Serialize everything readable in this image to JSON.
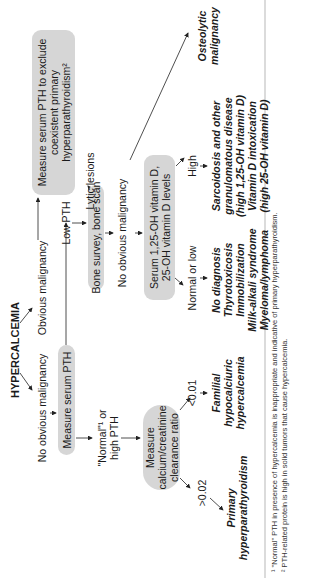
{
  "title": "HYPERCALCEMIA",
  "branches": {
    "no_malignancy": "No obvious malignancy",
    "obvious_malignancy": "Obvious malignancy",
    "normal_high_pth": [
      "\"Normal\"¹ or",
      "high PTH"
    ],
    "low_pth": "Low PTH",
    "no_obvious_malignancy_2": "No obvious malignancy",
    "lytic_lesions": "Lytic lesions",
    "normal_or_low": "Normal or low",
    "high": "High",
    "gt_002": ">0.02",
    "lt_001": "<0.01"
  },
  "boxes": {
    "measure_pth": "Measure serum PTH",
    "exclude_pth": [
      "Measure serum PTH to exclude",
      "coexistent primary",
      "hyperparathyroidism²"
    ],
    "bone_survey": "Bone survey, bone scan",
    "serum_vitd": [
      "Serum 1,25-OH vitamin D,",
      "25-OH vitamin D levels"
    ],
    "ca_cr": [
      "Measure",
      "calcium/creatinine",
      "clearance ratio"
    ]
  },
  "outcomes": {
    "primary_hpt": [
      "Primary",
      "hyperparathyroidism"
    ],
    "fhh": [
      "Familial",
      "hypocalciuric",
      "hypercalcemia"
    ],
    "normal_low_list": [
      "No diagnosis",
      "Thyrotoxicosis",
      "Immobilization",
      "Milk-alkali syndrome",
      "Myeloma/lymphoma"
    ],
    "high_list": [
      "Sarcoidosis and other",
      "granulomatous disease",
      "(high 1,25-OH vitamin D)",
      "Vitamin D intoxication",
      "(high 25-OH vitamin D)"
    ],
    "osteolytic": [
      "Osteolytic",
      "malignancy"
    ]
  },
  "footnotes": [
    "¹ \"Normal\" PTH in presence of hypercalcemia is inappropriate and indicative of primary hyperparathyroidism.",
    "² PTH-related protein is high in solid tumors that cause hypercalcemia."
  ]
}
